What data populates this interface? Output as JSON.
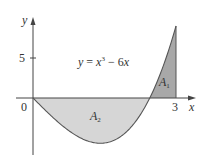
{
  "figure": {
    "equation": "y = x³ − 6x",
    "equation_parts": {
      "lhs": "y",
      "eq": " = ",
      "x": "x",
      "exp": "3",
      "rest": " − 6",
      "x2": "x"
    },
    "axis_x_label": "x",
    "axis_y_label": "y",
    "origin_label": "0",
    "y_tick_label": "5",
    "x_tick_label": "3",
    "region_1_label": "A",
    "region_1_sub": "1",
    "region_2_label": "A",
    "region_2_sub": "2",
    "colors": {
      "region_1_fill": "#a8a8a8",
      "region_2_fill": "#d6d6d6",
      "curve": "#555555",
      "axes": "#444444",
      "text": "#333333"
    }
  },
  "chart_data": {
    "type": "line",
    "title": "",
    "function": "y = x^3 - 6x",
    "xlabel": "x",
    "ylabel": "y",
    "x_ticks": [
      0,
      3
    ],
    "y_ticks": [
      5
    ],
    "xlim": [
      -1,
      3.3
    ],
    "ylim": [
      -7,
      10
    ],
    "x": [
      0,
      0.5,
      1,
      1.414,
      2,
      2.449,
      2.75,
      3
    ],
    "y": [
      0,
      -2.875,
      -5,
      -5.657,
      -4,
      0,
      4.3,
      9
    ],
    "regions": [
      {
        "name": "A1",
        "x_range": [
          2.449,
          3
        ],
        "sign": "above x-axis"
      },
      {
        "name": "A2",
        "x_range": [
          0,
          2.449
        ],
        "sign": "below x-axis"
      }
    ],
    "grid": false,
    "legend": null
  }
}
